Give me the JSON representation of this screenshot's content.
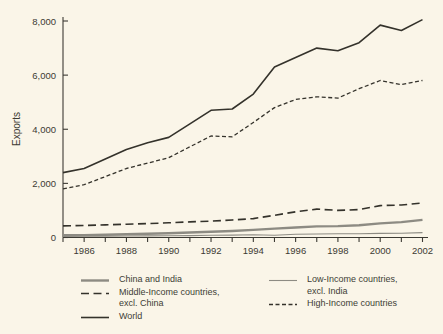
{
  "chart_data": {
    "type": "line",
    "title": "",
    "ylabel": "Exports",
    "xlabel": "",
    "xlim": [
      1985,
      2002
    ],
    "ylim": [
      0,
      8000
    ],
    "grid": false,
    "legend_position": "bottom",
    "x": [
      1985,
      1986,
      1987,
      1988,
      1989,
      1990,
      1991,
      1992,
      1993,
      1994,
      1995,
      1996,
      1997,
      1998,
      1999,
      2000,
      2001,
      2002
    ],
    "yticks": [
      {
        "value": 0,
        "label": "0"
      },
      {
        "value": 2000,
        "label": "2,000"
      },
      {
        "value": 4000,
        "label": "4,000"
      },
      {
        "value": 6000,
        "label": "6,000"
      },
      {
        "value": 8000,
        "label": "8,000"
      }
    ],
    "xticks": [
      {
        "value": 1986,
        "label": "1986"
      },
      {
        "value": 1988,
        "label": "1988"
      },
      {
        "value": 1990,
        "label": "1990"
      },
      {
        "value": 1992,
        "label": "1992"
      },
      {
        "value": 1994,
        "label": "1994"
      },
      {
        "value": 1996,
        "label": "1996"
      },
      {
        "value": 1998,
        "label": "1998"
      },
      {
        "value": 2000,
        "label": "2000"
      },
      {
        "value": 2002,
        "label": "2002"
      }
    ],
    "series": [
      {
        "key": "low_income",
        "name": "Low-Income countries, excl. India",
        "color": "#8d8b83",
        "width": 1.1,
        "dash": "",
        "values": [
          40,
          45,
          50,
          55,
          60,
          65,
          70,
          80,
          90,
          100,
          85,
          120,
          130,
          135,
          140,
          150,
          160,
          180
        ]
      },
      {
        "key": "china_india",
        "name": "China and India",
        "color": "#8d8b83",
        "width": 2.4,
        "dash": "",
        "values": [
          80,
          90,
          105,
          120,
          140,
          160,
          185,
          215,
          240,
          280,
          330,
          370,
          410,
          420,
          450,
          520,
          570,
          650
        ]
      },
      {
        "key": "middle_income",
        "name": "Middle-Income countries, excl. China",
        "color": "#34322b",
        "width": 1.6,
        "dash": "8,4.5",
        "values": [
          430,
          445,
          465,
          490,
          515,
          545,
          575,
          605,
          645,
          700,
          820,
          950,
          1050,
          1000,
          1030,
          1180,
          1200,
          1280
        ]
      },
      {
        "key": "high_income",
        "name": "High-Income countries",
        "color": "#34322b",
        "width": 1.3,
        "dash": "4,2.5",
        "values": [
          1800,
          1950,
          2250,
          2550,
          2750,
          2950,
          3350,
          3750,
          3720,
          4250,
          4800,
          5100,
          5200,
          5150,
          5500,
          5800,
          5650,
          5800
        ]
      },
      {
        "key": "world",
        "name": "World",
        "color": "#34322b",
        "width": 1.6,
        "dash": "",
        "values": [
          2400,
          2550,
          2900,
          3250,
          3500,
          3700,
          4200,
          4700,
          4750,
          5300,
          6300,
          6650,
          7000,
          6900,
          7200,
          7850,
          7650,
          8050
        ]
      }
    ]
  },
  "legend": {
    "columns": [
      {
        "items": [
          {
            "series": "china_india",
            "label": "China and India"
          },
          {
            "series": "middle_income",
            "label": "Middle-Income countries,\nexcl. China"
          },
          {
            "series": "world",
            "label": "World"
          }
        ]
      },
      {
        "items": [
          {
            "series": "low_income",
            "label": "Low-Income countries,\nexcl. India"
          },
          {
            "series": "high_income",
            "label": "High-Income countries"
          }
        ]
      }
    ]
  }
}
